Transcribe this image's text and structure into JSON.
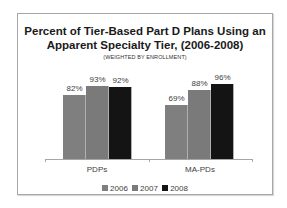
{
  "chart_data": {
    "type": "bar",
    "title": "Percent of Tier-Based Part D Plans Using an Apparent Specialty Tier, (2006-2008)",
    "title_line1": "Percent of Tier-Based Part D Plans Using an",
    "title_line2": "Apparent Specialty Tier, (2006-2008)",
    "subtitle": "(WEIGHTED BY ENROLLMENT)",
    "categories": [
      "PDPs",
      "MA-PDs"
    ],
    "series": [
      {
        "name": "2006",
        "values": [
          82,
          69
        ],
        "labels": [
          "82%",
          "69%"
        ],
        "color": "#7f7f7f"
      },
      {
        "name": "2007",
        "values": [
          93,
          88
        ],
        "labels": [
          "93%",
          "88%"
        ],
        "color": "#7a7a7a"
      },
      {
        "name": "2008",
        "values": [
          92,
          96
        ],
        "labels": [
          "92%",
          "96%"
        ],
        "color": "#141414"
      }
    ],
    "xlabel": "",
    "ylabel": "",
    "ylim": [
      0,
      100
    ],
    "grid": false,
    "legend_position": "bottom"
  }
}
